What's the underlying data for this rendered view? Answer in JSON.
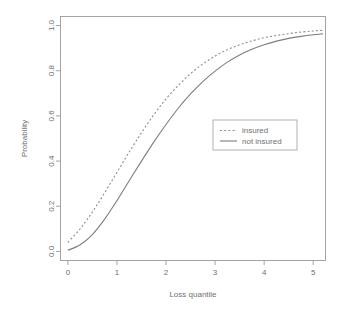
{
  "chart_data": {
    "type": "line",
    "title": "",
    "xlabel": "Loss quantile",
    "ylabel": "Probability",
    "xlim": [
      -0.15,
      5.25
    ],
    "ylim": [
      -0.04,
      1.04
    ],
    "xticks": [
      "0",
      "1",
      "2",
      "3",
      "4",
      "5"
    ],
    "xtick_values": [
      0,
      1,
      2,
      3,
      4,
      5
    ],
    "yticks": [
      "0.0",
      "0.2",
      "0.4",
      "0.6",
      "0.8",
      "1.0"
    ],
    "ytick_values": [
      0.0,
      0.2,
      0.4,
      0.6,
      0.8,
      1.0
    ],
    "grid": false,
    "legend_position": "center-right",
    "x": [
      0.0,
      0.25,
      0.5,
      0.75,
      1.0,
      1.25,
      1.5,
      1.75,
      2.0,
      2.25,
      2.5,
      2.75,
      3.0,
      3.25,
      3.5,
      3.75,
      4.0,
      4.25,
      4.5,
      4.75,
      5.0,
      5.2
    ],
    "series": [
      {
        "name": "insured",
        "style": "dashed",
        "color": "#8d8d8d",
        "values": [
          0.04,
          0.1,
          0.175,
          0.26,
          0.35,
          0.44,
          0.525,
          0.605,
          0.675,
          0.735,
          0.787,
          0.83,
          0.865,
          0.893,
          0.915,
          0.932,
          0.946,
          0.956,
          0.964,
          0.971,
          0.976,
          0.979
        ]
      },
      {
        "name": "not insured",
        "style": "solid",
        "color": "#7d7d7d",
        "values": [
          0.005,
          0.03,
          0.075,
          0.143,
          0.225,
          0.313,
          0.4,
          0.484,
          0.562,
          0.634,
          0.697,
          0.752,
          0.798,
          0.838,
          0.87,
          0.895,
          0.915,
          0.931,
          0.943,
          0.952,
          0.959,
          0.963
        ]
      }
    ]
  },
  "legend": {
    "entries": [
      {
        "label": "insured"
      },
      {
        "label": "not insured"
      }
    ]
  }
}
